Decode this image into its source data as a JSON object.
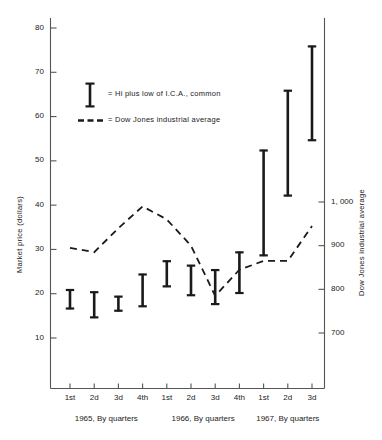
{
  "chart_data": {
    "type": "bar",
    "title": "",
    "subtitle": "",
    "xlabel": "",
    "ylabel": "Market price (dollars)",
    "ylabel_secondary": "Dow Jones industrial average",
    "grid": false,
    "legend_position": "inside-upper-left",
    "categories": [
      "1st",
      "2d",
      "3d",
      "4th",
      "1st",
      "2d",
      "3d",
      "4th",
      "1st",
      "2d",
      "3d"
    ],
    "group_labels": [
      "1965, By quarters",
      "1966, By quarters",
      "1967, By quarters"
    ],
    "group_spans": [
      [
        0,
        3
      ],
      [
        4,
        7
      ],
      [
        8,
        10
      ]
    ],
    "ylim": [
      0,
      80
    ],
    "yticks": [
      10,
      20,
      30,
      40,
      50,
      60,
      70,
      80
    ],
    "ytick_labels": [
      "10",
      "20",
      "30",
      "40",
      "50",
      "60",
      "70",
      "80"
    ],
    "ylim_secondary": [
      560,
      1130
    ],
    "yticks_secondary": [
      700,
      800,
      900,
      1000
    ],
    "ytick_labels_secondary": [
      "700",
      "800",
      "900",
      "1, 000"
    ],
    "series": [
      {
        "name": "Hi plus low of I.C.A., common",
        "type": "range-bar",
        "marker": "vertical-bar-with-caps",
        "ranges": [
          {
            "quarter": "1965 1st",
            "low": 16.5,
            "high": 21.0
          },
          {
            "quarter": "1965 2d",
            "low": 14.5,
            "high": 20.5
          },
          {
            "quarter": "1965 3d",
            "low": 16.0,
            "high": 19.5
          },
          {
            "quarter": "1965 4th",
            "low": 17.0,
            "high": 24.5
          },
          {
            "quarter": "1966 1st",
            "low": 21.5,
            "high": 27.5
          },
          {
            "quarter": "1966 2d",
            "low": 19.5,
            "high": 26.5
          },
          {
            "quarter": "1966 3d",
            "low": 17.5,
            "high": 25.5
          },
          {
            "quarter": "1966 4th",
            "low": 20.0,
            "high": 29.5
          },
          {
            "quarter": "1967 1st",
            "low": 28.5,
            "high": 52.5
          },
          {
            "quarter": "1967 2d",
            "low": 42.0,
            "high": 66.0
          },
          {
            "quarter": "1967 3d",
            "low": 54.5,
            "high": 76.0
          }
        ]
      },
      {
        "name": "Dow Jones industrial average",
        "type": "line",
        "style": "dashed",
        "axis": "secondary",
        "values": [
          895,
          885,
          940,
          990,
          960,
          900,
          785,
          845,
          865,
          865,
          945
        ]
      }
    ],
    "legend": [
      {
        "marker": "vertical-bar-with-caps",
        "label": "= Hi plus low of I.C.A., common"
      },
      {
        "marker": "dashed-line",
        "label": "= Dow  Jones industrial average"
      }
    ]
  },
  "colors": {
    "ink": "#1a1a1a",
    "axis": "#555555",
    "background": "#ffffff"
  }
}
